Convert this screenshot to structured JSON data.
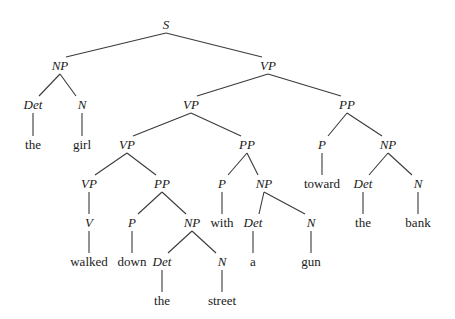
{
  "diagram": {
    "type": "parse-tree",
    "sentence": "the girl walked down the street with a gun toward the bank",
    "nodes": [
      {
        "id": "n0",
        "label": "S",
        "kind": "category",
        "x": 166,
        "y": 25
      },
      {
        "id": "n1",
        "label": "NP",
        "kind": "category",
        "x": 60,
        "y": 66,
        "parent": "n0"
      },
      {
        "id": "n2",
        "label": "Det",
        "kind": "category",
        "x": 33,
        "y": 105,
        "parent": "n1"
      },
      {
        "id": "n3",
        "label": "the",
        "kind": "word",
        "x": 33,
        "y": 145,
        "parent": "n2"
      },
      {
        "id": "n4",
        "label": "N",
        "kind": "category",
        "x": 82,
        "y": 105,
        "parent": "n1"
      },
      {
        "id": "n5",
        "label": "girl",
        "kind": "word",
        "x": 82,
        "y": 145,
        "parent": "n4"
      },
      {
        "id": "n6",
        "label": "VP",
        "kind": "category",
        "x": 268,
        "y": 66,
        "parent": "n0"
      },
      {
        "id": "n7",
        "label": "VP",
        "kind": "category",
        "x": 191,
        "y": 105,
        "parent": "n6"
      },
      {
        "id": "n8",
        "label": "VP",
        "kind": "category",
        "x": 127,
        "y": 145,
        "parent": "n7"
      },
      {
        "id": "n9",
        "label": "VP",
        "kind": "category",
        "x": 89,
        "y": 184,
        "parent": "n8"
      },
      {
        "id": "n10",
        "label": "V",
        "kind": "category",
        "x": 89,
        "y": 223,
        "parent": "n9"
      },
      {
        "id": "n11",
        "label": "walked",
        "kind": "word",
        "x": 89,
        "y": 262,
        "parent": "n10"
      },
      {
        "id": "n12",
        "label": "PP",
        "kind": "category",
        "x": 162,
        "y": 184,
        "parent": "n8"
      },
      {
        "id": "n13",
        "label": "P",
        "kind": "category",
        "x": 132,
        "y": 223,
        "parent": "n12"
      },
      {
        "id": "n14",
        "label": "down",
        "kind": "word",
        "x": 132,
        "y": 262,
        "parent": "n13"
      },
      {
        "id": "n15",
        "label": "NP",
        "kind": "category",
        "x": 192,
        "y": 223,
        "parent": "n12"
      },
      {
        "id": "n16",
        "label": "Det",
        "kind": "category",
        "x": 162,
        "y": 262,
        "parent": "n15"
      },
      {
        "id": "n17",
        "label": "the",
        "kind": "word",
        "x": 162,
        "y": 301,
        "parent": "n16"
      },
      {
        "id": "n18",
        "label": "N",
        "kind": "category",
        "x": 222,
        "y": 262,
        "parent": "n15"
      },
      {
        "id": "n19",
        "label": "street",
        "kind": "word",
        "x": 222,
        "y": 301,
        "parent": "n18"
      },
      {
        "id": "n20",
        "label": "PP",
        "kind": "category",
        "x": 247,
        "y": 145,
        "parent": "n7"
      },
      {
        "id": "n21",
        "label": "P",
        "kind": "category",
        "x": 222,
        "y": 184,
        "parent": "n20"
      },
      {
        "id": "n22",
        "label": "with",
        "kind": "word",
        "x": 222,
        "y": 223,
        "parent": "n21"
      },
      {
        "id": "n23",
        "label": "NP",
        "kind": "category",
        "x": 264,
        "y": 184,
        "parent": "n20"
      },
      {
        "id": "n24",
        "label": "Det",
        "kind": "category",
        "x": 253,
        "y": 223,
        "parent": "n23"
      },
      {
        "id": "n25",
        "label": "a",
        "kind": "word",
        "x": 253,
        "y": 262,
        "parent": "n24"
      },
      {
        "id": "n26",
        "label": "N",
        "kind": "category",
        "x": 311,
        "y": 223,
        "parent": "n23"
      },
      {
        "id": "n27",
        "label": "gun",
        "kind": "word",
        "x": 311,
        "y": 262,
        "parent": "n26"
      },
      {
        "id": "n28",
        "label": "PP",
        "kind": "category",
        "x": 347,
        "y": 105,
        "parent": "n6"
      },
      {
        "id": "n29",
        "label": "P",
        "kind": "category",
        "x": 322,
        "y": 145,
        "parent": "n28"
      },
      {
        "id": "n30",
        "label": "toward",
        "kind": "word",
        "x": 322,
        "y": 184,
        "parent": "n29"
      },
      {
        "id": "n31",
        "label": "NP",
        "kind": "category",
        "x": 388,
        "y": 145,
        "parent": "n28"
      },
      {
        "id": "n32",
        "label": "Det",
        "kind": "category",
        "x": 363,
        "y": 184,
        "parent": "n31"
      },
      {
        "id": "n33",
        "label": "the",
        "kind": "word",
        "x": 363,
        "y": 223,
        "parent": "n32"
      },
      {
        "id": "n34",
        "label": "N",
        "kind": "category",
        "x": 418,
        "y": 184,
        "parent": "n31"
      },
      {
        "id": "n35",
        "label": "bank",
        "kind": "word",
        "x": 418,
        "y": 223,
        "parent": "n34"
      }
    ]
  }
}
